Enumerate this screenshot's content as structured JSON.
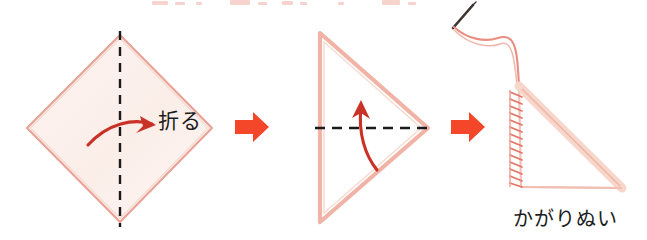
{
  "document": {
    "kind": "craft-instruction-diagram",
    "language": "ja",
    "background_color": "#ffffff",
    "width": 647,
    "height": 240
  },
  "palette": {
    "fabric_outline": "#e9a295",
    "fabric_fill": "#fdf2ef",
    "fabric_edge_highlight": "#f6cfc4",
    "step_arrow": "#f4472a",
    "motion_arrow": "#c93226",
    "fold_line": "#1a1a1a",
    "thread": "#e98e80",
    "needle": "#3a3330",
    "text": "#1c1c1c"
  },
  "steps": [
    {
      "index": 1,
      "name": "fold-square-in-half",
      "shape": "diamond",
      "fold_line": "vertical-dashed",
      "motion": "curved-arrow-right",
      "label": "折る"
    },
    {
      "index": 2,
      "name": "fold-triangle-in-half",
      "shape": "triangle",
      "fold_line": "horizontal-dashed",
      "motion": "curved-arrow-up",
      "label": ""
    },
    {
      "index": 3,
      "name": "whipstitch-edge",
      "shape": "right-triangle",
      "stitching": "whipstitch-left-edge",
      "tool": "needle-and-thread",
      "label": "かがりぬい"
    }
  ],
  "connectors": [
    {
      "name": "step-arrow-1-to-2",
      "direction": "right",
      "color": "#f4472a"
    },
    {
      "name": "step-arrow-2-to-3",
      "direction": "right",
      "color": "#f4472a"
    }
  ],
  "labels": {
    "fold": "折る",
    "whipstitch": "かがりぬい"
  },
  "top_cut_strip": {
    "note": "partially cropped heading at the top edge of the scan",
    "ticks": [
      {
        "x": 152,
        "w": 16,
        "h": 4
      },
      {
        "x": 175,
        "w": 10,
        "h": 3
      },
      {
        "x": 196,
        "w": 6,
        "h": 3
      },
      {
        "x": 230,
        "w": 20,
        "h": 5
      },
      {
        "x": 258,
        "w": 9,
        "h": 3
      },
      {
        "x": 282,
        "w": 11,
        "h": 4
      },
      {
        "x": 300,
        "w": 7,
        "h": 3
      },
      {
        "x": 338,
        "w": 6,
        "h": 3
      },
      {
        "x": 382,
        "w": 18,
        "h": 5
      },
      {
        "x": 408,
        "w": 8,
        "h": 3
      }
    ]
  }
}
